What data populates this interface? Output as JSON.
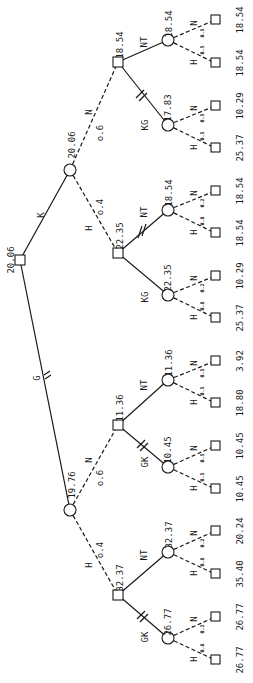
{
  "diagram": {
    "type": "decision-tree",
    "orientation": "rotated-90-ccw",
    "root": {
      "value": "20.06"
    },
    "chance_level1": [
      {
        "branch": "K",
        "value": "20.06"
      },
      {
        "branch": "G",
        "value": "19.76"
      }
    ],
    "decision_level2": [
      {
        "branch": "N",
        "prob": "o.6",
        "value": "18.54"
      },
      {
        "branch": "H",
        "prob": "o.4",
        "value": "22.35"
      },
      {
        "branch": "N",
        "prob": "o.6",
        "value": "11.36"
      },
      {
        "branch": "H",
        "prob": "o.4",
        "value": "32.37"
      }
    ],
    "chance_level3": [
      {
        "branch": "NT",
        "value": "18.54"
      },
      {
        "branch": "KG",
        "value": "17.83"
      },
      {
        "branch": "NT",
        "value": "18.54"
      },
      {
        "branch": "KG",
        "value": "22.35"
      },
      {
        "branch": "NT",
        "value": "11.36"
      },
      {
        "branch": "GK",
        "value": "10.45"
      },
      {
        "branch": "NT",
        "value": "32.37"
      },
      {
        "branch": "GK",
        "value": "26.77"
      }
    ],
    "leaves": [
      {
        "branch": "N",
        "prob": "0.5",
        "payoff": "18.54"
      },
      {
        "branch": "H",
        "prob": "0.5",
        "payoff": "18.54"
      },
      {
        "branch": "N",
        "prob": "0.5",
        "payoff": "10.29"
      },
      {
        "branch": "H",
        "prob": "0.5",
        "payoff": "25.37"
      },
      {
        "branch": "N",
        "prob": "0.2",
        "payoff": "18.54"
      },
      {
        "branch": "H",
        "prob": "0.8",
        "payoff": "18.54"
      },
      {
        "branch": "N",
        "prob": "0.2",
        "payoff": "10.29"
      },
      {
        "branch": "H",
        "prob": "0.8",
        "payoff": "25.37"
      },
      {
        "branch": "N",
        "prob": "0.5",
        "payoff": "3.92"
      },
      {
        "branch": "H",
        "prob": "0.5",
        "payoff": "18.80"
      },
      {
        "branch": "N",
        "prob": "0.5",
        "payoff": "10.45"
      },
      {
        "branch": "H",
        "prob": "0.5",
        "payoff": "10.45"
      },
      {
        "branch": "N",
        "prob": "0.2",
        "payoff": "20.24"
      },
      {
        "branch": "H",
        "prob": "0.8",
        "payoff": "35.40"
      },
      {
        "branch": "N",
        "prob": "0.2",
        "payoff": "26.77"
      },
      {
        "branch": "H",
        "prob": "0.8",
        "payoff": "26.77"
      }
    ]
  }
}
